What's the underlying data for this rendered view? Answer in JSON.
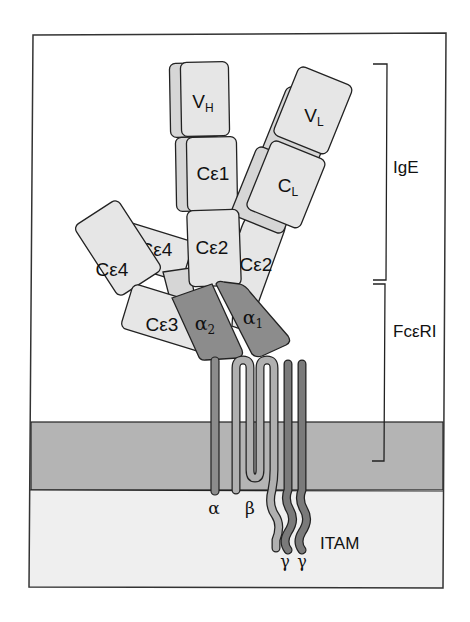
{
  "diagram": {
    "colors": {
      "background": "#ffffff",
      "frame": "#333333",
      "ig_domain": "#e6e6e6",
      "alpha_domain": "#8c8c8c",
      "membrane": "#b4b4b4",
      "cytoplasm": "#efefef",
      "beta_chain": "#b0b0b0",
      "gamma_chain": "#7a7a7a",
      "alpha_tm": "#8c8c8c"
    },
    "ige_domains": {
      "vh": {
        "main": "V",
        "sub": "H"
      },
      "vl": {
        "main": "V",
        "sub": "L"
      },
      "ce1": "Cε1",
      "cl": {
        "main": "C",
        "sub": "L"
      },
      "ce2_center": "Cε2",
      "ce2_right": "Cε2",
      "ce4_left": "Cε4",
      "ce4_top": "Cε4",
      "ce3": "Cε3"
    },
    "receptor": {
      "alpha2": {
        "main": "α",
        "sub": "2"
      },
      "alpha1": {
        "main": "α",
        "sub": "1"
      },
      "chain_alpha": "α",
      "chain_beta": "β",
      "chain_gamma1": "γ",
      "chain_gamma2": "γ",
      "itam": "ITAM"
    },
    "brackets": {
      "ige": "IgE",
      "fceri": "FcεRI"
    }
  }
}
